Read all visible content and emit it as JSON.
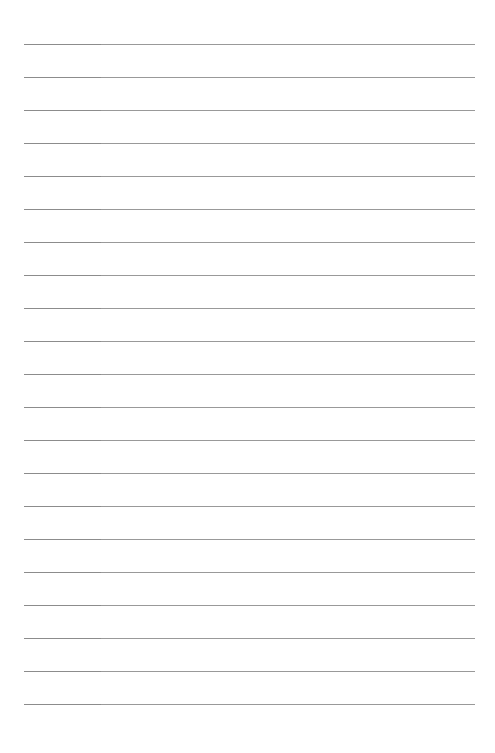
{
  "page": {
    "type": "lined-paper",
    "background_color": "#ffffff",
    "line_color": "#999999",
    "line_color_left_segment": "#8c8c8c",
    "line_count": 21,
    "first_line_y": 44,
    "line_spacing": 33,
    "line_left_x": 24,
    "line_right_x": 475,
    "left_segment_end_x": 101,
    "lines": [
      {
        "index": 1,
        "text": ""
      },
      {
        "index": 2,
        "text": ""
      },
      {
        "index": 3,
        "text": ""
      },
      {
        "index": 4,
        "text": ""
      },
      {
        "index": 5,
        "text": ""
      },
      {
        "index": 6,
        "text": ""
      },
      {
        "index": 7,
        "text": ""
      },
      {
        "index": 8,
        "text": ""
      },
      {
        "index": 9,
        "text": ""
      },
      {
        "index": 10,
        "text": ""
      },
      {
        "index": 11,
        "text": ""
      },
      {
        "index": 12,
        "text": ""
      },
      {
        "index": 13,
        "text": ""
      },
      {
        "index": 14,
        "text": ""
      },
      {
        "index": 15,
        "text": ""
      },
      {
        "index": 16,
        "text": ""
      },
      {
        "index": 17,
        "text": ""
      },
      {
        "index": 18,
        "text": ""
      },
      {
        "index": 19,
        "text": ""
      },
      {
        "index": 20,
        "text": ""
      },
      {
        "index": 21,
        "text": ""
      }
    ]
  }
}
